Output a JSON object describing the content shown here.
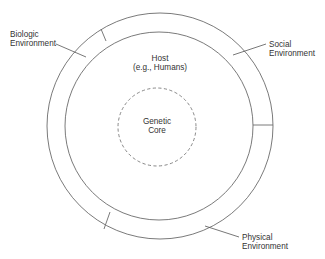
{
  "diagram": {
    "colors": {
      "line": "#6b6b6b",
      "text": "#333333",
      "background": "#ffffff"
    },
    "labels": {
      "biologic": {
        "line1": "Biologic",
        "line2": "Environment"
      },
      "social": {
        "line1": "Social",
        "line2": "Environment"
      },
      "physical": {
        "line1": "Physical",
        "line2": "Environment"
      },
      "host": {
        "line1": "Host",
        "line2": "(e.g., Humans)"
      },
      "core": {
        "line1": "Genetic",
        "line2": "Core"
      }
    },
    "rings": [
      {
        "name": "environment-ring-outer",
        "cx": 160,
        "cy": 126,
        "r": 113
      },
      {
        "name": "host-ring",
        "cx": 159,
        "cy": 126,
        "r": 94
      },
      {
        "name": "genetic-core",
        "cx": 157,
        "cy": 127,
        "r": 39,
        "style": "dashed"
      }
    ],
    "segments": [
      "Biologic Environment",
      "Social Environment",
      "Physical Environment"
    ]
  }
}
